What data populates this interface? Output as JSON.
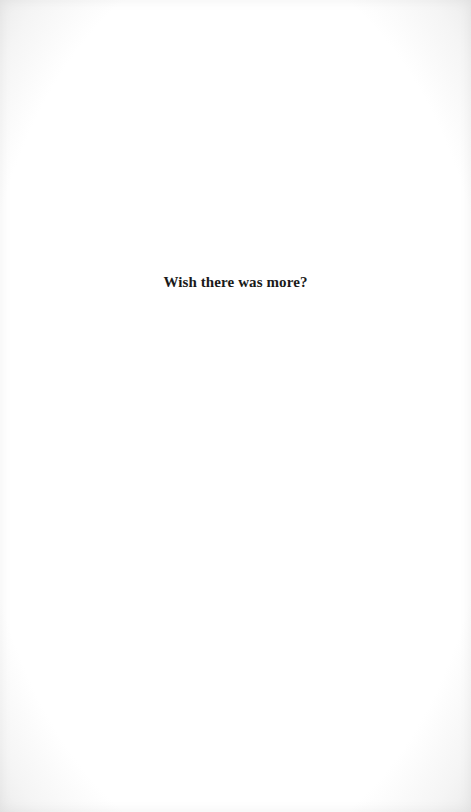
{
  "page": {
    "heading": "Wish there was more?",
    "background_color": "#ffffff",
    "text_color": "#1a1a1a"
  }
}
